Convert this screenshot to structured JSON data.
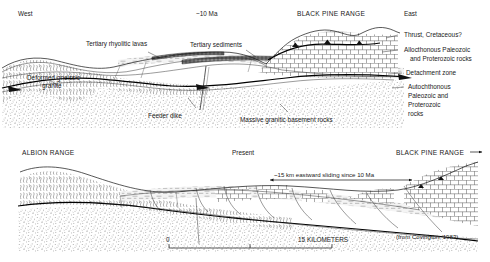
{
  "figure": {
    "source_credit": "(from Covington, 1983)"
  },
  "top_panel": {
    "time_label": "~10 Ma",
    "direction_left": "West",
    "direction_right": "East",
    "range_name": "BLACK PINE RANGE",
    "labels": {
      "rhyolitic_lavas": "Tertiary rhyolitic lavas",
      "sediments": "Tertiary sediments",
      "deformed_granite_line1": "Deformed gneissic",
      "deformed_granite_line2": "granite",
      "feeder_dike": "Feeder dike",
      "basement": "Massive granitic basement rocks",
      "thrust": "Thrust, Cretaceous?",
      "allochthon_line1": "Allocthonous Paleozoic",
      "allochthon_line2": "and Proterozoic rocks",
      "detachment": "Detachment zone",
      "autochthon_line1": "Autochthonous",
      "autochthon_line2": "Paleozoic and",
      "autochthon_line3": "Proterozoic",
      "autochthon_line4": "rocks"
    }
  },
  "bottom_panel": {
    "time_label": "Present",
    "range_left": "ALBION RANGE",
    "range_right": "BLACK PINE RANGE",
    "range_right_arrow": "→",
    "sliding_note": "~15 km eastward sliding since 10 Ma",
    "scale": {
      "start": "0",
      "end": "15 KILOMETERS"
    }
  },
  "colors": {
    "ink": "#111111",
    "sediment_fill": "#f2f2f2",
    "background": "#ffffff"
  }
}
